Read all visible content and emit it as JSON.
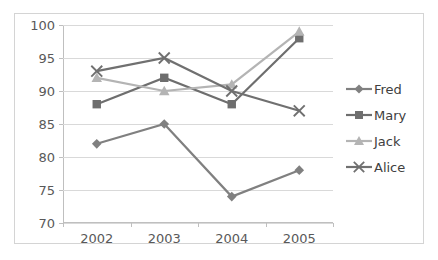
{
  "chart_data": {
    "type": "line",
    "title": "",
    "xlabel": "",
    "ylabel": "",
    "categories": [
      "2002",
      "2003",
      "2004",
      "2005"
    ],
    "ylim": [
      70,
      100
    ],
    "ytick_step": 5,
    "yticks": [
      70,
      75,
      80,
      85,
      90,
      95,
      100
    ],
    "grid": true,
    "legend_position": "right",
    "series": [
      {
        "name": "Fred",
        "marker": "diamond",
        "color": "#808080",
        "values": [
          82,
          85,
          74,
          78
        ]
      },
      {
        "name": "Mary",
        "marker": "square",
        "color": "#6e6e6e",
        "values": [
          88,
          92,
          88,
          98
        ]
      },
      {
        "name": "Jack",
        "marker": "triangle",
        "color": "#b4b4b4",
        "values": [
          92,
          90,
          91,
          99
        ]
      },
      {
        "name": "Alice",
        "marker": "x",
        "color": "#707070",
        "values": [
          93,
          95,
          90,
          87
        ]
      }
    ]
  },
  "axes": {
    "y_tick_labels": [
      "100",
      "95",
      "90",
      "85",
      "80",
      "75",
      "70"
    ],
    "x_tick_labels": [
      "2002",
      "2003",
      "2004",
      "2005"
    ]
  },
  "legend": {
    "items": [
      {
        "label": "Fred"
      },
      {
        "label": "Mary"
      },
      {
        "label": "Jack"
      },
      {
        "label": "Alice"
      }
    ]
  },
  "colors": {
    "frame_border": "#d4d4d4",
    "gridline": "#d9d9d9",
    "axis_line": "#bfbfbf",
    "tick_text": "#595959",
    "legend_text": "#404040"
  }
}
